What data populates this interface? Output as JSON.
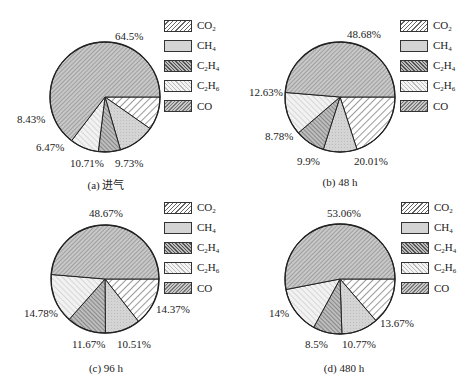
{
  "chart_data": [
    {
      "type": "pie",
      "title": "(a) 进气",
      "categories": [
        "CO2",
        "CH4",
        "C2H4",
        "C2H6",
        "CO"
      ],
      "values": [
        9.73,
        10.71,
        6.47,
        8.43,
        64.5
      ],
      "labels": [
        "9.73%",
        "10.71%",
        "6.47%",
        "8.43%",
        "64.5%"
      ],
      "legend_position": "right"
    },
    {
      "type": "pie",
      "title": "(b) 48 h",
      "categories": [
        "CO2",
        "CH4",
        "C2H4",
        "C2H6",
        "CO"
      ],
      "values": [
        20.01,
        9.9,
        8.78,
        12.63,
        48.68
      ],
      "labels": [
        "20.01%",
        "9.9%",
        "8.78%",
        "12.63%",
        "48.68%"
      ],
      "legend_position": "right"
    },
    {
      "type": "pie",
      "title": "(c) 96 h",
      "categories": [
        "CO2",
        "CH4",
        "C2H4",
        "C2H6",
        "CO"
      ],
      "values": [
        14.37,
        10.51,
        11.67,
        14.78,
        48.67
      ],
      "labels": [
        "14.37%",
        "10.51%",
        "11.67%",
        "14.78%",
        "48.67%"
      ],
      "legend_position": "right"
    },
    {
      "type": "pie",
      "title": "(d) 480 h",
      "categories": [
        "CO2",
        "CH4",
        "C2H4",
        "C2H6",
        "CO"
      ],
      "values": [
        13.67,
        10.77,
        8.5,
        14,
        53.06
      ],
      "labels": [
        "13.67%",
        "10.77%",
        "8.5%",
        "14%",
        "53.06%"
      ],
      "legend_position": "right"
    }
  ],
  "legend": {
    "items": [
      {
        "base": "CO",
        "sub": "2",
        "tail": ""
      },
      {
        "base": "CH",
        "sub": "4",
        "tail": ""
      },
      {
        "base": "C",
        "sub": "2",
        "mid": "H",
        "sub2": "4"
      },
      {
        "base": "C",
        "sub": "2",
        "mid": "H",
        "sub2": "6"
      },
      {
        "base": "CO",
        "sub": "",
        "tail": ""
      }
    ]
  },
  "panels": [
    {
      "caption": "(a) 进气",
      "labels": {
        "co2": "9.73%",
        "ch4": "10.71%",
        "c2h4": "6.47%",
        "c2h6": "8.43%",
        "co": "64.5%"
      }
    },
    {
      "caption": "(b) 48 h",
      "labels": {
        "co2": "20.01%",
        "ch4": "9.9%",
        "c2h4": "8.78%",
        "c2h6": "12.63%",
        "co": "48.68%"
      }
    },
    {
      "caption": "(c) 96 h",
      "labels": {
        "co2": "14.37%",
        "ch4": "10.51%",
        "c2h4": "11.67%",
        "c2h6": "14.78%",
        "co": "48.67%"
      }
    },
    {
      "caption": "(d) 480 h",
      "labels": {
        "co2": "13.67%",
        "ch4": "10.77%",
        "c2h4": "8.5%",
        "c2h6": "14%",
        "co": "53.06%"
      }
    }
  ]
}
